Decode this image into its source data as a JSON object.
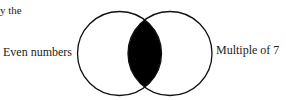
{
  "caption_fragment": "y the",
  "venn": {
    "left_set_label": "Even numbers",
    "right_set_label": "Multiple of 7",
    "shaded_region": "intersection",
    "colors": {
      "stroke": "#111111",
      "fill_shaded": "#000000",
      "background": "#ffffff"
    }
  }
}
